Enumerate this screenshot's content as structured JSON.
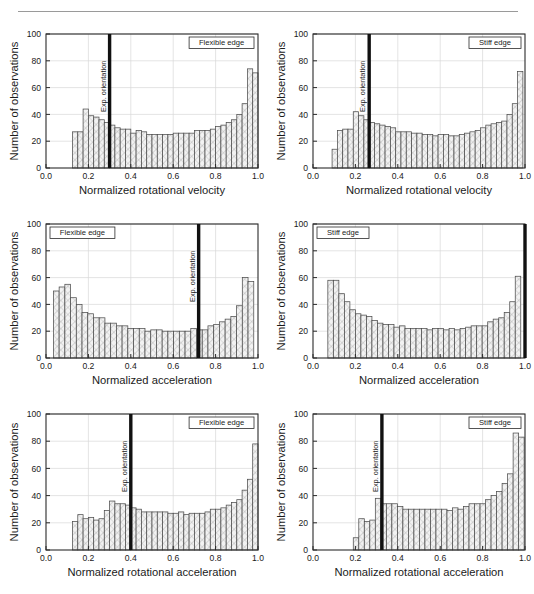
{
  "figure": {
    "panel_count": 6,
    "y_axis_label": "Number of observations",
    "y_ticks": [
      "0",
      "20",
      "40",
      "60",
      "80",
      "100"
    ],
    "x_ticks": [
      "0.0",
      "0.2",
      "0.4",
      "0.6",
      "0.8",
      "1.0"
    ],
    "orientation_label": "Exp. orientation",
    "bar_fill": "#f2f2f2",
    "bar_stroke": "#4d4d4d",
    "hatch_color": "#a8a8a8",
    "orientation_line_color": "#111111",
    "grid_color": "#d9d9d9",
    "axis_color": "#2b2b2b"
  },
  "chart_data": [
    {
      "id": "panel-top-left",
      "type": "bar",
      "title": "",
      "badge": "Flexible edge",
      "badge_position": "top-right",
      "xlabel": "Normalized rotational velocity",
      "ylabel": "Number of observations",
      "xlim": [
        0.0,
        1.0
      ],
      "ylim": [
        0,
        100
      ],
      "grid": true,
      "bin_width": 0.025,
      "bin_starts": [
        0.125,
        0.15,
        0.175,
        0.2,
        0.225,
        0.25,
        0.275,
        0.3,
        0.325,
        0.35,
        0.375,
        0.4,
        0.425,
        0.45,
        0.475,
        0.5,
        0.525,
        0.55,
        0.575,
        0.6,
        0.625,
        0.65,
        0.675,
        0.7,
        0.725,
        0.75,
        0.775,
        0.8,
        0.825,
        0.85,
        0.875,
        0.9,
        0.925,
        0.95,
        0.975
      ],
      "values": [
        27,
        27,
        44,
        39,
        38,
        36,
        34,
        32,
        30,
        29,
        29,
        26,
        28,
        27,
        25,
        25,
        25,
        25,
        25,
        26,
        26,
        26,
        26,
        28,
        28,
        28,
        29,
        31,
        32,
        34,
        36,
        40,
        48,
        74,
        71
      ],
      "annotations": [
        {
          "type": "vline",
          "label": "Exp. orientation",
          "x": 0.3
        }
      ]
    },
    {
      "id": "panel-top-right",
      "type": "bar",
      "title": "",
      "badge": "Stiff edge",
      "badge_position": "top-right",
      "xlabel": "Normalized rotational velocity",
      "ylabel": "Number of observations",
      "xlim": [
        0.0,
        1.0
      ],
      "ylim": [
        0,
        100
      ],
      "grid": true,
      "bin_width": 0.025,
      "bin_starts": [
        0.09,
        0.115,
        0.14,
        0.165,
        0.19,
        0.215,
        0.24,
        0.265,
        0.29,
        0.315,
        0.34,
        0.365,
        0.39,
        0.415,
        0.44,
        0.465,
        0.49,
        0.515,
        0.54,
        0.565,
        0.59,
        0.615,
        0.64,
        0.665,
        0.69,
        0.715,
        0.74,
        0.765,
        0.79,
        0.815,
        0.84,
        0.865,
        0.89,
        0.915,
        0.94,
        0.965
      ],
      "values": [
        14,
        28,
        29,
        29,
        42,
        39,
        36,
        34,
        33,
        32,
        31,
        30,
        27,
        27,
        27,
        26,
        26,
        25,
        25,
        24,
        25,
        25,
        24,
        24,
        25,
        26,
        27,
        28,
        30,
        32,
        33,
        34,
        35,
        40,
        48,
        72
      ],
      "annotations": [
        {
          "type": "vline",
          "label": "Exp. orientation",
          "x": 0.265
        }
      ]
    },
    {
      "id": "panel-mid-left",
      "type": "bar",
      "title": "",
      "badge": "Flexible edge",
      "badge_position": "top-left",
      "xlabel": "Normalized acceleration",
      "ylabel": "Number of observations",
      "xlim": [
        0.0,
        1.0
      ],
      "ylim": [
        0,
        100
      ],
      "grid": true,
      "bin_width": 0.027,
      "bin_starts": [
        0.035,
        0.062,
        0.089,
        0.116,
        0.143,
        0.17,
        0.197,
        0.224,
        0.251,
        0.278,
        0.305,
        0.332,
        0.359,
        0.386,
        0.413,
        0.44,
        0.467,
        0.494,
        0.521,
        0.548,
        0.575,
        0.602,
        0.629,
        0.656,
        0.683,
        0.71,
        0.737,
        0.764,
        0.791,
        0.818,
        0.845,
        0.872,
        0.899,
        0.926,
        0.953
      ],
      "values": [
        50,
        53,
        55,
        45,
        40,
        34,
        33,
        30,
        30,
        26,
        26,
        24,
        24,
        22,
        22,
        22,
        20,
        21,
        21,
        20,
        20,
        20,
        20,
        20,
        22,
        21,
        21,
        24,
        25,
        27,
        29,
        31,
        39,
        60,
        57
      ],
      "annotations": [
        {
          "type": "vline",
          "label": "Exp. orientation",
          "x": 0.72
        }
      ]
    },
    {
      "id": "panel-mid-right",
      "type": "bar",
      "title": "",
      "badge": "Stiff edge",
      "badge_position": "top-left",
      "xlabel": "Normalized acceleration",
      "ylabel": "Number of observations",
      "xlim": [
        0.0,
        1.0
      ],
      "ylim": [
        0,
        100
      ],
      "grid": true,
      "bin_width": 0.026,
      "bin_starts": [
        0.07,
        0.096,
        0.122,
        0.148,
        0.174,
        0.2,
        0.226,
        0.252,
        0.278,
        0.304,
        0.33,
        0.356,
        0.382,
        0.408,
        0.434,
        0.46,
        0.486,
        0.512,
        0.538,
        0.564,
        0.59,
        0.616,
        0.642,
        0.668,
        0.694,
        0.72,
        0.746,
        0.772,
        0.798,
        0.824,
        0.85,
        0.876,
        0.902,
        0.928,
        0.954
      ],
      "values": [
        58,
        58,
        48,
        42,
        36,
        33,
        32,
        31,
        28,
        26,
        25,
        25,
        23,
        24,
        22,
        22,
        22,
        22,
        21,
        22,
        22,
        21,
        22,
        21,
        22,
        23,
        24,
        24,
        24,
        27,
        29,
        30,
        34,
        42,
        61
      ],
      "annotations": [
        {
          "type": "vline",
          "label": "",
          "x": 1.0
        }
      ]
    },
    {
      "id": "panel-bot-left",
      "type": "bar",
      "title": "",
      "badge": "Flexible edge",
      "badge_position": "top-right",
      "xlabel": "Normalized rotational acceleration",
      "ylabel": "Number of observations",
      "xlim": [
        0.0,
        1.0
      ],
      "ylim": [
        0,
        100
      ],
      "grid": true,
      "bin_width": 0.025,
      "bin_starts": [
        0.125,
        0.15,
        0.175,
        0.2,
        0.225,
        0.25,
        0.275,
        0.3,
        0.325,
        0.35,
        0.375,
        0.4,
        0.425,
        0.45,
        0.475,
        0.5,
        0.525,
        0.55,
        0.575,
        0.6,
        0.625,
        0.65,
        0.675,
        0.7,
        0.725,
        0.75,
        0.775,
        0.8,
        0.825,
        0.85,
        0.875,
        0.9,
        0.925,
        0.95,
        0.975
      ],
      "values": [
        21,
        26,
        23,
        24,
        22,
        23,
        29,
        36,
        34,
        34,
        33,
        31,
        30,
        28,
        28,
        28,
        28,
        28,
        27,
        27,
        28,
        26,
        27,
        27,
        27,
        28,
        30,
        30,
        31,
        33,
        35,
        37,
        44,
        52,
        78
      ],
      "annotations": [
        {
          "type": "vline",
          "label": "Exp. orientation",
          "x": 0.4
        }
      ]
    },
    {
      "id": "panel-bot-right",
      "type": "bar",
      "title": "",
      "badge": "Stiff edge",
      "badge_position": "top-right",
      "xlabel": "Normalized rotational acceleration",
      "ylabel": "Number of observations",
      "xlim": [
        0.0,
        1.0
      ],
      "ylim": [
        0,
        100
      ],
      "grid": true,
      "bin_width": 0.026,
      "bin_starts": [
        0.19,
        0.216,
        0.242,
        0.268,
        0.294,
        0.32,
        0.346,
        0.372,
        0.398,
        0.424,
        0.45,
        0.476,
        0.502,
        0.528,
        0.554,
        0.58,
        0.606,
        0.632,
        0.658,
        0.684,
        0.71,
        0.736,
        0.762,
        0.788,
        0.814,
        0.84,
        0.866,
        0.892,
        0.918,
        0.944,
        0.97
      ],
      "values": [
        9,
        23,
        21,
        22,
        38,
        34,
        34,
        34,
        32,
        30,
        30,
        30,
        30,
        30,
        30,
        30,
        30,
        29,
        31,
        30,
        32,
        34,
        34,
        34,
        37,
        40,
        43,
        49,
        56,
        86,
        83
      ],
      "annotations": [
        {
          "type": "vline",
          "label": "Exp. orientation",
          "x": 0.325
        }
      ]
    }
  ]
}
